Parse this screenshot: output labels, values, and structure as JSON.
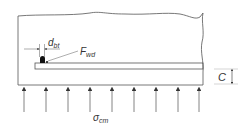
{
  "diagram": {
    "type": "engineering-schematic",
    "colors": {
      "line": "#555555",
      "weld": "#111111",
      "text": "#333333",
      "background": "#ffffff"
    },
    "labels": {
      "weld_width": {
        "main": "d",
        "sub": "bt"
      },
      "weld_force": {
        "main": "F",
        "sub": "wd"
      },
      "pressure": {
        "main": "σ",
        "sub": "cm"
      },
      "clearance": {
        "main": "C"
      }
    },
    "pressure_arrows": {
      "count": 9,
      "x_positions": [
        24,
        46,
        68,
        90,
        112,
        134,
        156,
        178,
        199
      ]
    }
  }
}
